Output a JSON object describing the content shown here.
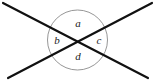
{
  "figure": {
    "type": "geometry-diagram",
    "background_color": "#ffffff",
    "line_color": "#111111",
    "circle_color": "#8a8a8a",
    "label_color": "#1a1a1a",
    "canvas": {
      "width": 155,
      "height": 82
    },
    "circle": {
      "cx": 77.5,
      "cy": 40,
      "r": 30,
      "stroke_width": 0.9
    },
    "lines": [
      {
        "name": "line-top-left-to-bottom-right",
        "x1": 3,
        "y1": 3,
        "x2": 148,
        "y2": 78,
        "stroke_width": 2.2
      },
      {
        "name": "line-top-right-to-bottom-left",
        "x1": 152,
        "y1": 3,
        "x2": 8,
        "y2": 78,
        "stroke_width": 2.2
      }
    ],
    "intersection": {
      "x": 77.5,
      "y": 40
    },
    "labels": [
      {
        "id": "a",
        "text": "a",
        "position": "top",
        "x": 78,
        "y": 24
      },
      {
        "id": "b",
        "text": "b",
        "position": "left",
        "x": 57,
        "y": 41
      },
      {
        "id": "c",
        "text": "c",
        "position": "right",
        "x": 99,
        "y": 41
      },
      {
        "id": "d",
        "text": "d",
        "position": "bottom",
        "x": 78,
        "y": 57
      }
    ]
  }
}
